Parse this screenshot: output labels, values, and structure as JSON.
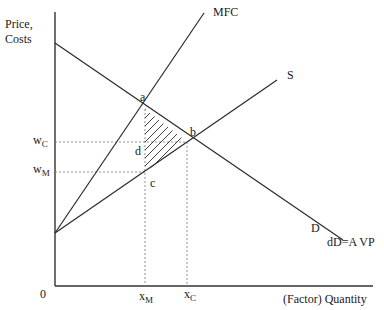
{
  "figure": {
    "y_axis_label_line1": "Price,",
    "y_axis_label_line2": "Costs",
    "x_axis_label": "(Factor) Quantity",
    "origin_label": "0"
  },
  "curves": {
    "mfc_label": "MFC",
    "supply_label": "S",
    "demand_label": "D",
    "demand_avp_label": "dD=A VP"
  },
  "points": {
    "a": "a",
    "b": "b",
    "c": "c",
    "d": "d"
  },
  "axis_marks": {
    "wc_main": "w",
    "wc_sub": "C",
    "wm_main": "w",
    "wm_sub": "M",
    "xm_main": "x",
    "xm_sub": "M",
    "xc_main": "x",
    "xc_sub": "C"
  },
  "colors": {
    "line": "#2a2a2a",
    "axis": "#333333",
    "dashed": "#777777",
    "hatch": "#2a2a2a"
  }
}
